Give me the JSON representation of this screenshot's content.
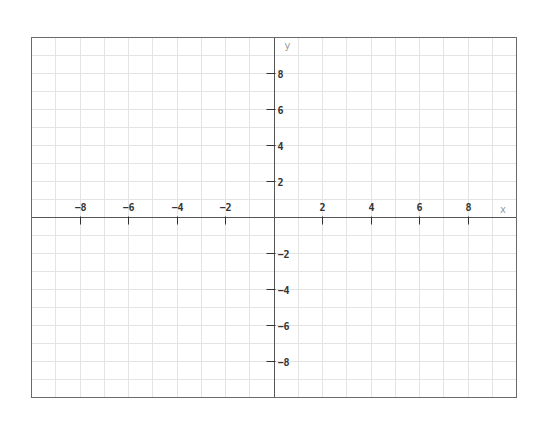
{
  "chart_data": {
    "type": "scatter",
    "title": "",
    "xlabel": "x",
    "ylabel": "y",
    "xlim": [
      -10,
      10
    ],
    "ylim": [
      -10,
      10
    ],
    "grid": true,
    "grid_step": 1,
    "x_ticks": [
      -8,
      -6,
      -4,
      -2,
      2,
      4,
      6,
      8
    ],
    "y_ticks": [
      8,
      6,
      4,
      2,
      -2,
      -4,
      -6,
      -8
    ],
    "x_tick_labels": [
      "−8",
      "−6",
      "−4",
      "−2",
      "2",
      "4",
      "6",
      "8"
    ],
    "y_tick_labels": [
      "8",
      "6",
      "4",
      "2",
      "−2",
      "−4",
      "−6",
      "−8"
    ],
    "series": [],
    "legend": null
  },
  "frame": {
    "left": 31,
    "top": 37,
    "right": 516,
    "bottom": 397
  },
  "colors": {
    "grid": "#e4e4e4",
    "axis": "#555555",
    "frame": "#6a6a6a",
    "tick_label": "#333333",
    "axis_name": "#9a9a9a"
  }
}
